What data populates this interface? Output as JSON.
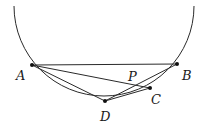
{
  "diagram": {
    "type": "geometry",
    "circle": {
      "cx": 104,
      "cy": 11,
      "r": 90,
      "arc_from": [
        14,
        6
      ],
      "arc_to": [
        194,
        6
      ]
    },
    "points": [
      {
        "name": "A",
        "x": 32,
        "y": 65,
        "label": "A",
        "label_x": 16,
        "label_y": 80
      },
      {
        "name": "B",
        "x": 177,
        "y": 64,
        "label": "B",
        "label_x": 182,
        "label_y": 80
      },
      {
        "name": "C",
        "x": 150,
        "y": 88,
        "label": "C",
        "label_x": 151,
        "label_y": 104
      },
      {
        "name": "D",
        "x": 105,
        "y": 101,
        "label": "D",
        "label_x": 100,
        "label_y": 121
      }
    ],
    "intersection": {
      "name": "P",
      "label": "P",
      "label_x": 128,
      "label_y": 81
    },
    "segments": [
      {
        "from": "A",
        "to": "B"
      },
      {
        "from": "A",
        "to": "C"
      },
      {
        "from": "A",
        "to": "D"
      },
      {
        "from": "D",
        "to": "B"
      },
      {
        "from": "D",
        "to": "C"
      }
    ],
    "stroke_color": "#2a2a2a",
    "point_color": "#111111"
  }
}
